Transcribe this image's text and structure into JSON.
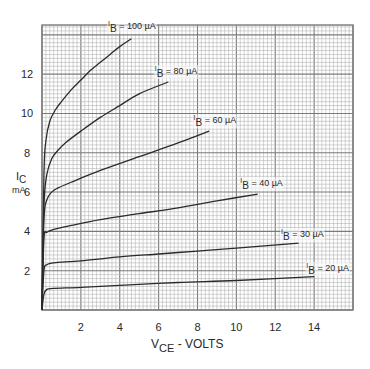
{
  "chart_data": {
    "type": "line",
    "title": "",
    "xlabel": "V_CE - VOLTS",
    "xlabel_main": "V",
    "xlabel_sub": "CE",
    "xlabel_rest": " - VOLTS",
    "ylabel": "I_C mA",
    "ylabel_main": "I",
    "ylabel_sub": "C",
    "ylabel_unit": "mA",
    "xlim": [
      0,
      16
    ],
    "ylim": [
      0,
      14.5
    ],
    "xticks": [
      2,
      4,
      6,
      8,
      10,
      12,
      14
    ],
    "yticks": [
      2,
      4,
      6,
      8,
      10,
      12
    ],
    "grid": true,
    "grid_major_x": 2,
    "grid_major_y": 2,
    "grid_minor_divisions": 10,
    "legend_position": "inline labels at curve ends",
    "series": [
      {
        "name": "I_B = 100 µA",
        "label_value": "100",
        "x": [
          0,
          0.1,
          0.2,
          0.4,
          0.7,
          1.0,
          1.5,
          2.0,
          2.5,
          3.0,
          3.5,
          4.0,
          4.6
        ],
        "y": [
          0,
          6.9,
          8.6,
          9.6,
          10.2,
          10.6,
          11.2,
          11.7,
          12.2,
          12.6,
          13.0,
          13.4,
          13.8
        ],
        "label_pos": [
          3.4,
          14.3
        ]
      },
      {
        "name": "I_B = 80 µA",
        "label_value": "80",
        "x": [
          0,
          0.1,
          0.25,
          0.5,
          0.8,
          1.2,
          2.0,
          3.0,
          4.0,
          5.0,
          6.5
        ],
        "y": [
          0,
          5.3,
          6.9,
          7.7,
          8.1,
          8.5,
          9.1,
          9.8,
          10.4,
          11.0,
          11.6
        ],
        "label_pos": [
          5.8,
          12.0
        ]
      },
      {
        "name": "I_B = 60 µA",
        "label_value": "60",
        "x": [
          0,
          0.1,
          0.25,
          0.5,
          0.8,
          1.5,
          3.0,
          5.0,
          7.0,
          8.6
        ],
        "y": [
          0,
          4.6,
          5.6,
          6.0,
          6.2,
          6.5,
          7.1,
          7.8,
          8.5,
          9.1
        ],
        "label_pos": [
          7.8,
          9.5
        ]
      },
      {
        "name": "I_B = 40 µA",
        "label_value": "40",
        "x": [
          0,
          0.1,
          0.25,
          0.6,
          1.5,
          3.0,
          5.0,
          7.0,
          9.0,
          11.1
        ],
        "y": [
          0,
          3.6,
          3.95,
          4.1,
          4.3,
          4.6,
          4.9,
          5.2,
          5.55,
          5.9
        ],
        "label_pos": [
          10.2,
          6.3
        ]
      },
      {
        "name": "I_B = 30 µA",
        "label_value": "30",
        "x": [
          0,
          0.1,
          0.25,
          0.6,
          2.0,
          4.0,
          6.0,
          8.0,
          10.0,
          13.2
        ],
        "y": [
          0,
          2.0,
          2.3,
          2.4,
          2.5,
          2.7,
          2.85,
          3.0,
          3.15,
          3.4
        ],
        "label_pos": [
          12.3,
          3.7
        ]
      },
      {
        "name": "I_B = 20 µA",
        "label_value": "20",
        "x": [
          0,
          0.1,
          0.25,
          0.6,
          2.0,
          4.0,
          7.0,
          10.0,
          14.0
        ],
        "y": [
          0,
          0.8,
          1.05,
          1.1,
          1.15,
          1.25,
          1.4,
          1.5,
          1.7
        ],
        "label_pos": [
          13.6,
          2.0
        ]
      }
    ],
    "label_prefix_main": "I",
    "label_prefix_sub": "B",
    "label_eq": " = ",
    "label_unit": " µA"
  },
  "colors": {
    "grid_minor": "#b4b4b4",
    "grid_major": "#7a7a7a",
    "curve": "#2a2a2a",
    "text": "#2a2a2a",
    "background": "#ffffff"
  }
}
